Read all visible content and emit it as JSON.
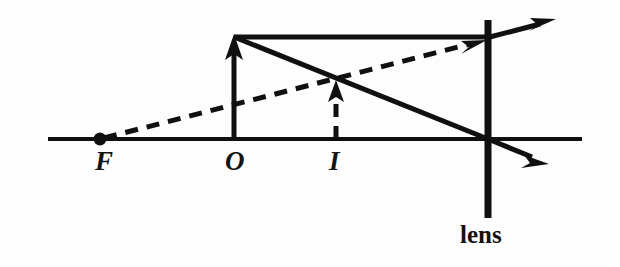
{
  "figure": {
    "kind": "ray-diagram",
    "title_visible": false,
    "background_color": "#fdfdfd",
    "ink_color": "#101010",
    "width": 620,
    "height": 267
  },
  "labels": {
    "focal_point": "F",
    "object": "O",
    "image": "I",
    "lens": "lens"
  },
  "label_positions": {
    "focal_point": {
      "x": 95,
      "y": 148
    },
    "object": {
      "x": 225,
      "y": 148
    },
    "image": {
      "x": 329,
      "y": 148
    },
    "lens": {
      "x": 460,
      "y": 222
    }
  },
  "geometry": {
    "optical_axis": {
      "x1": 48,
      "y1": 139,
      "x2": 582,
      "y2": 139
    },
    "lens_line": {
      "x": 488,
      "y_top": 20,
      "y_bottom": 218
    },
    "focal_point_dot": {
      "cx": 100,
      "cy": 139,
      "r": 6
    },
    "object_arrow": {
      "x": 234,
      "y_base": 139,
      "y_tip": 37
    },
    "image_arrow": {
      "x": 336,
      "y_base": 139,
      "y_tip": 84
    },
    "ray_parallel": {
      "x1": 234,
      "y1": 37,
      "x2": 488,
      "y2": 37
    },
    "ray_parallel_refracted": {
      "x1": 488,
      "y1": 37,
      "x2": 548,
      "y2": 21
    },
    "ray_through_center": {
      "x1": 234,
      "y1": 37,
      "x2": 488,
      "y2": 139
    },
    "ray_through_center_continued": {
      "x1": 488,
      "y1": 139,
      "x2": 545,
      "y2": 162
    },
    "ray_virtual_dashed": {
      "x1": 100,
      "y1": 139,
      "x2": 484,
      "y2": 41
    }
  },
  "style": {
    "axis_stroke_width": 4,
    "lens_stroke_width": 7,
    "ray_stroke_width": 5,
    "dash_pattern": "13 9",
    "dash_stroke_width": 5
  }
}
